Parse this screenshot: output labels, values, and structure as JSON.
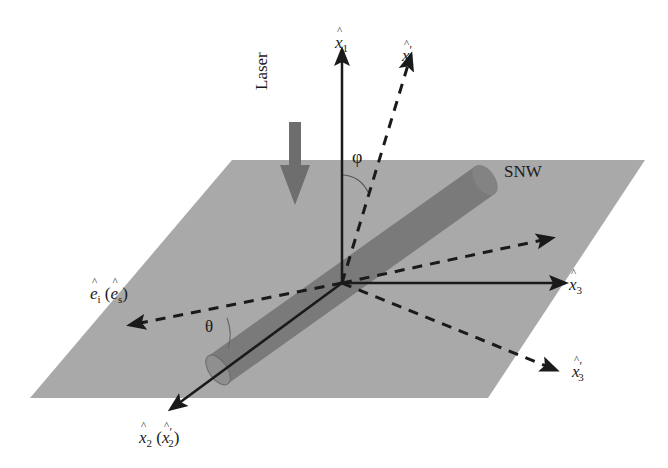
{
  "figure": {
    "type": "3D coordinate diagram",
    "plane_color": "#a9a9a9",
    "nanowire_color": "#7a7a7a",
    "laser_arrow_color": "#6e6e6e",
    "axis_color": "#1a1a1a"
  },
  "labels": {
    "x1": {
      "base": "x",
      "sub": "1",
      "prime": ""
    },
    "x1_prime": {
      "base": "x",
      "sub": "1",
      "prime": "′"
    },
    "x2": {
      "base": "x",
      "sub": "2",
      "paren_base": "x",
      "paren_sub": "2",
      "paren_prime": "′"
    },
    "x3": {
      "base": "x",
      "sub": "3",
      "prime": ""
    },
    "x3_prime": {
      "base": "x",
      "sub": "3",
      "prime": "′"
    },
    "polarization": {
      "base": "e",
      "sub": "i",
      "paren_base": "e",
      "paren_sub": "s"
    },
    "laser": "Laser",
    "snw": "SNW",
    "phi": "φ",
    "theta": "θ"
  }
}
